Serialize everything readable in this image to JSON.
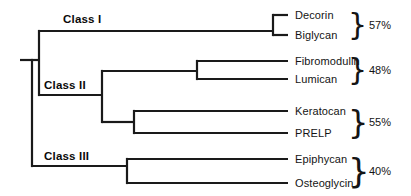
{
  "figure": {
    "type": "phylogenetic-tree",
    "width": 411,
    "height": 196,
    "background_color": "#ffffff",
    "line_color": "#1a1a1a",
    "text_color": "#141414",
    "brace_glyph": "}"
  },
  "classes": [
    {
      "id": "class-1",
      "label": "Class I",
      "x": 63,
      "y": 20
    },
    {
      "id": "class-2",
      "label": "Class II",
      "x": 44,
      "y": 86
    },
    {
      "id": "class-3",
      "label": "Class III",
      "x": 44,
      "y": 157
    }
  ],
  "taxa": [
    {
      "id": "decorin",
      "label": "Decorin",
      "x": 295,
      "y": 15
    },
    {
      "id": "biglycan",
      "label": "Biglycan",
      "x": 295,
      "y": 35
    },
    {
      "id": "fibromodulin",
      "label": "Fibromodulin",
      "x": 295,
      "y": 61
    },
    {
      "id": "lumican",
      "label": "Lumican",
      "x": 295,
      "y": 79
    },
    {
      "id": "keratocan",
      "label": "Keratocan",
      "x": 295,
      "y": 111
    },
    {
      "id": "prelp",
      "label": "PRELP",
      "x": 295,
      "y": 133
    },
    {
      "id": "epiphycan",
      "label": "Epiphycan",
      "x": 295,
      "y": 159
    },
    {
      "id": "osteoglycin",
      "label": "Osteoglycin",
      "x": 295,
      "y": 183
    }
  ],
  "identity_groups": [
    {
      "id": "group-decorin-biglycan",
      "value": "57%",
      "brace_x": 348,
      "brace_y": 25,
      "brace_height": 30,
      "value_x": 369,
      "value_y": 25,
      "members": [
        "Decorin",
        "Biglycan"
      ]
    },
    {
      "id": "group-fibromodulin-lumican",
      "value": "48%",
      "brace_x": 348,
      "brace_y": 70,
      "brace_height": 30,
      "value_x": 369,
      "value_y": 70,
      "members": [
        "Fibromodulin",
        "Lumican"
      ]
    },
    {
      "id": "group-keratocan-prelp",
      "value": "55%",
      "brace_x": 348,
      "brace_y": 122,
      "brace_height": 32,
      "value_x": 369,
      "value_y": 122,
      "members": [
        "Keratocan",
        "PRELP"
      ]
    },
    {
      "id": "group-epiphycan-osteoglycin",
      "value": "40%",
      "brace_x": 348,
      "brace_y": 171,
      "brace_height": 34,
      "value_x": 369,
      "value_y": 171,
      "members": [
        "Epiphycan",
        "Osteoglycin"
      ]
    }
  ],
  "chart_data": {
    "type": "dendrogram",
    "title": "",
    "leaf_tip_x": 288,
    "nodes": {
      "root": {
        "x": 32,
        "y_top": 60,
        "y_bottom": 166,
        "stem_from_x": 20,
        "stem_y": 60
      },
      "class1_class2": {
        "x": 39,
        "y_top": 31,
        "y_bottom": 95
      },
      "class2_split": {
        "x": 102,
        "y_top": 71,
        "y_bottom": 122
      },
      "fibro_lumican": {
        "x": 197,
        "y_top": 61,
        "y_bottom": 79
      },
      "keratocan_prelp": {
        "x": 134,
        "y_top": 111,
        "y_bottom": 133
      },
      "decorin_biglycan": {
        "x": 273,
        "y_top": 15,
        "y_bottom": 35
      },
      "class3_split": {
        "x": 127,
        "y_top": 159,
        "y_bottom": 183
      }
    },
    "edges": [
      {
        "from": "root",
        "to": "class1_class2",
        "y": 60,
        "x1": 32,
        "x2": 39
      },
      {
        "from": "root",
        "to": "class3_split",
        "y": 166,
        "x1": 32,
        "x2": 127
      },
      {
        "from": "class1_class2",
        "to": "decorin_biglycan",
        "y": 31,
        "x1": 39,
        "x2": 273
      },
      {
        "from": "class1_class2",
        "to": "class2_split",
        "y": 95,
        "x1": 39,
        "x2": 102
      },
      {
        "from": "class2_split",
        "to": "fibro_lumican",
        "y": 71,
        "x1": 102,
        "x2": 197
      },
      {
        "from": "class2_split",
        "to": "keratocan_prelp",
        "y": 122,
        "x1": 102,
        "x2": 134
      },
      {
        "from": "fibro_lumican",
        "to": "fibromodulin",
        "y": 61,
        "x1": 197,
        "x2": 288
      },
      {
        "from": "fibro_lumican",
        "to": "lumican",
        "y": 79,
        "x1": 197,
        "x2": 288
      },
      {
        "from": "keratocan_prelp",
        "to": "keratocan",
        "y": 111,
        "x1": 134,
        "x2": 288
      },
      {
        "from": "keratocan_prelp",
        "to": "prelp",
        "y": 133,
        "x1": 134,
        "x2": 288
      },
      {
        "from": "decorin_biglycan",
        "to": "decorin",
        "y": 15,
        "x1": 273,
        "x2": 288
      },
      {
        "from": "decorin_biglycan",
        "to": "biglycan",
        "y": 35,
        "x1": 273,
        "x2": 288
      },
      {
        "from": "class3_split",
        "to": "epiphycan",
        "y": 159,
        "x1": 127,
        "x2": 288
      },
      {
        "from": "class3_split",
        "to": "osteoglycin",
        "y": 183,
        "x1": 127,
        "x2": 288
      }
    ],
    "leaves": [
      "Decorin",
      "Biglycan",
      "Fibromodulin",
      "Lumican",
      "Keratocan",
      "PRELP",
      "Epiphycan",
      "Osteoglycin"
    ],
    "group_labels": [
      "Class I",
      "Class II",
      "Class III"
    ],
    "identity_values": [
      "57%",
      "48%",
      "55%",
      "40%"
    ]
  }
}
